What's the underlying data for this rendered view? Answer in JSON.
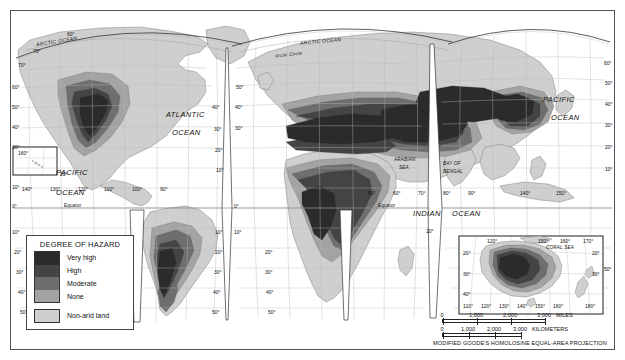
{
  "map": {
    "title_note": "MODIFIED GOODE'S HOMOLOSINE EQUAL-AREA PROJECTION",
    "projection": "MODIFIED GOODE'S HOMOLOSINE EQUAL-AREA PROJECTION"
  },
  "legend": {
    "title": "DEGREE OF HAZARD",
    "items": [
      {
        "label": "Very high",
        "color": "#2b2b2b"
      },
      {
        "label": "High",
        "color": "#444444"
      },
      {
        "label": "Moderate",
        "color": "#6e6e6e"
      },
      {
        "label": "None",
        "color": "#a3a3a3"
      }
    ],
    "extra": {
      "label": "Non-arid land",
      "color": "#cfcfcf"
    }
  },
  "scale": {
    "miles": {
      "ticks": [
        "0",
        "1,000",
        "2,000",
        "3,000"
      ],
      "unit": "MILES"
    },
    "kilometers": {
      "ticks": [
        "0",
        "1,000",
        "2,000",
        "3,000"
      ],
      "unit": "KILOMETERS"
    }
  },
  "ocean_labels": [
    {
      "id": "arctic-ocean-left",
      "text": "ARCTIC OCEAN"
    },
    {
      "id": "arctic-ocean-right",
      "text": "ARCTIC OCEAN"
    },
    {
      "id": "arctic-circle",
      "text": "Arctic Circle"
    },
    {
      "id": "atlantic-ocean-1",
      "text": "ATLANTIC"
    },
    {
      "id": "atlantic-ocean-2",
      "text": "OCEAN"
    },
    {
      "id": "pacific-ocean-left-1",
      "text": "PACIFIC"
    },
    {
      "id": "pacific-ocean-left-2",
      "text": "OCEAN"
    },
    {
      "id": "pacific-ocean-right-1",
      "text": "PACIFIC"
    },
    {
      "id": "pacific-ocean-right-2",
      "text": "OCEAN"
    },
    {
      "id": "indian-ocean-1",
      "text": "INDIAN"
    },
    {
      "id": "indian-ocean-2",
      "text": "OCEAN"
    },
    {
      "id": "arabian-sea-1",
      "text": "ARABIAN"
    },
    {
      "id": "arabian-sea-2",
      "text": "SEA"
    },
    {
      "id": "bay-of-bengal-1",
      "text": "BAY OF"
    },
    {
      "id": "bay-of-bengal-2",
      "text": "BENGAL"
    },
    {
      "id": "coral-sea",
      "text": "CORAL SEA"
    },
    {
      "id": "equator-left",
      "text": "Equator"
    },
    {
      "id": "equator-right",
      "text": "Equator"
    }
  ],
  "graticule": {
    "left_latitudes": [
      "70°",
      "60°",
      "50°",
      "40°",
      "30°",
      "20°",
      "10°",
      "0°",
      "10°",
      "20°",
      "30°",
      "40°",
      "50°"
    ],
    "center_latitudes": [
      "50°",
      "40°",
      "30°",
      "0°",
      "10°",
      "20°",
      "30°",
      "40°",
      "50°"
    ],
    "africa_latitudes": [
      "50°",
      "40°",
      "30°",
      "20°",
      "10°",
      "0°",
      "10°",
      "20°",
      "30°",
      "40°",
      "50°"
    ],
    "right_latitudes": [
      "60°",
      "50°",
      "40°",
      "30°",
      "20°",
      "10°"
    ],
    "pacific_longitudes": [
      "140°",
      "130°",
      "120°",
      "110°",
      "100°",
      "90°"
    ],
    "indian_longitudes": [
      "50°",
      "60°",
      "70°",
      "80°",
      "90°"
    ],
    "east_longitudes": [
      "140°",
      "150°"
    ],
    "hawaii_inset_longitude": "160°",
    "north_top_label": "60°",
    "north_70_label": "70°"
  },
  "australia_inset": {
    "top_longitudes": [
      "120°",
      "150°",
      "160°",
      "170°"
    ],
    "bottom_longitudes": [
      "110°",
      "120°",
      "130°",
      "140°",
      "150°",
      "160°",
      "180°"
    ],
    "left_latitudes": [
      "20°",
      "30°",
      "40°"
    ],
    "right_latitudes": [
      "20°",
      "30°"
    ],
    "sea_label": "CORAL SEA"
  },
  "colors": {
    "very_high": "#2b2b2b",
    "high": "#444444",
    "moderate": "#6e6e6e",
    "none": "#a3a3a3",
    "non_arid": "#cfcfcf",
    "ocean": "#ffffff",
    "frame": "#555555"
  }
}
